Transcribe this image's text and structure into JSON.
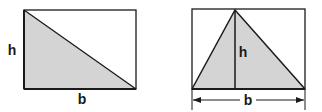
{
  "figures": [
    {
      "name": "right-triangle-in-rectangle",
      "height_label": "h",
      "base_label": "b"
    },
    {
      "name": "general-triangle-in-rectangle",
      "height_label": "h",
      "base_label": "b"
    }
  ],
  "colors": {
    "stroke": "#1a1a1a",
    "fill": "#d4d4d4",
    "background": "#ffffff"
  }
}
